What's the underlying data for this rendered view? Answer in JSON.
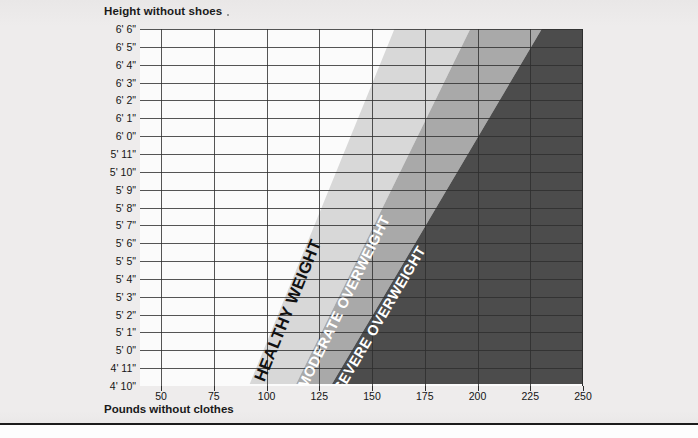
{
  "axes": {
    "y_title": "Height without shoes",
    "x_title": "Pounds without clothes"
  },
  "chart_data": {
    "type": "area",
    "title": "",
    "xlabel": "Pounds without clothes",
    "ylabel": "Height without shoes",
    "xlim": [
      40,
      250
    ],
    "x_ticks": [
      50,
      75,
      100,
      125,
      150,
      175,
      200,
      225,
      250
    ],
    "x_tick_labels": [
      "50",
      "75",
      "100",
      "125",
      "150",
      "175",
      "200",
      "225",
      "250"
    ],
    "y_ticks": [
      "4' 10\"",
      "4' 11\"",
      "5' 0\"",
      "5' 1\"",
      "5' 2\"",
      "5' 3\"",
      "5' 4\"",
      "5' 5\"",
      "5' 6\"",
      "5' 7\"",
      "5' 8\"",
      "5' 9\"",
      "5' 10\"",
      "5' 11\"",
      "6' 0\"",
      "6' 1\"",
      "6' 2\"",
      "6' 3\"",
      "6' 4\"",
      "6' 5\"",
      "6' 6\""
    ],
    "y_tick_labels_top_down": [
      "6' 6\"",
      "6' 5\"",
      "6' 4\"",
      "6' 3\"",
      "6' 2\"",
      "6' 1\"",
      "6' 0\"",
      "5' 11\"",
      "5' 10\"",
      "5' 9\"",
      "5' 8\"",
      "5' 7\"",
      "5' 6\"",
      "5' 5\"",
      "5' 4\"",
      "5' 3\"",
      "5' 2\"",
      "5' 1\"",
      "5' 0\"",
      "4' 11\"",
      "4' 10\""
    ],
    "grid": true,
    "legend": "none",
    "bands": [
      {
        "name": "underweight",
        "label": "",
        "color": "#fbfbfb",
        "start_lb_at_4ft10": 40,
        "start_lb_at_6ft6": 40,
        "end_lb_at_4ft10": 92,
        "end_lb_at_6ft6": 161
      },
      {
        "name": "healthy-weight",
        "label": "HEALTHY WEIGHT",
        "color": "#d8d8d8",
        "text_color": "#111111",
        "start_lb_at_4ft10": 92,
        "start_lb_at_6ft6": 161,
        "end_lb_at_4ft10": 114,
        "end_lb_at_6ft6": 197
      },
      {
        "name": "moderate-overweight",
        "label": "MODERATE OVERWEIGHT",
        "color": "#a9a9a9",
        "text_color": "#ffffff",
        "start_lb_at_4ft10": 114,
        "start_lb_at_6ft6": 197,
        "end_lb_at_4ft10": 131,
        "end_lb_at_6ft6": 231
      },
      {
        "name": "severe-overweight",
        "label": "SEVERE OVERWEIGHT",
        "color": "#4c4c4c",
        "text_color": "#ffffff",
        "start_lb_at_4ft10": 131,
        "start_lb_at_6ft6": 231,
        "end_lb_at_4ft10": 250,
        "end_lb_at_6ft6": 250
      }
    ]
  },
  "colors": {
    "page_background": "#eceaea",
    "plot_background": "#fbfbfb",
    "grid": "#2e2e2e",
    "healthy": "#d8d8d8",
    "moderate": "#a9a9a9",
    "severe": "#4c4c4c",
    "text": "#151515",
    "rule": "#1b1b1b"
  }
}
